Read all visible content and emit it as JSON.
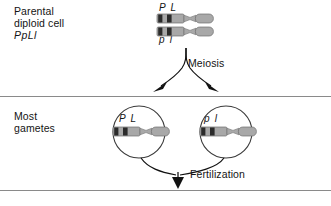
{
  "diagram": {
    "width": 331,
    "height": 206,
    "background_color": "#ffffff"
  },
  "colors": {
    "text": "#141414",
    "divider": "#8a8a8a",
    "chromosome_body": "#a8a8a8",
    "chromosome_band": "#2b2b2b",
    "chromosome_outline": "#6e6e6e",
    "arrow": "#111111",
    "cell_outline": "#3a3a3a"
  },
  "sections": {
    "parental": {
      "label_line1": "Parental",
      "label_line2": "diploid cell",
      "genotype": "PpLl"
    },
    "gametes": {
      "label_line1": "Most",
      "label_line2": "gametes"
    }
  },
  "chromosomes": {
    "parental_top_alleles": "P L",
    "parental_bottom_alleles": "p l",
    "gamete_left_alleles": "P L",
    "gamete_right_alleles": "p l"
  },
  "processes": {
    "meiosis": "Meiosis",
    "fertilization": "Fertilization"
  }
}
